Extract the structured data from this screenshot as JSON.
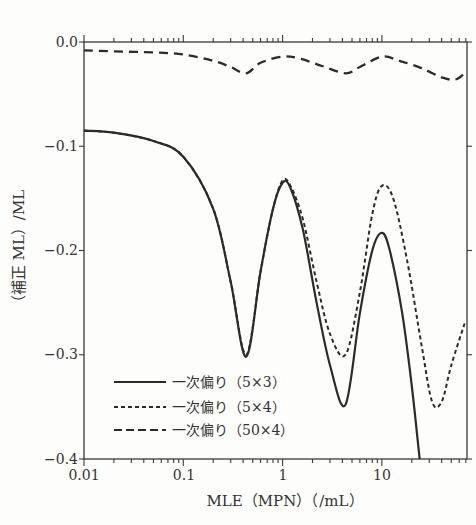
{
  "chart_data": {
    "type": "line",
    "title": "",
    "xlabel": "MLE（MPN）（/mL）",
    "ylabel": "（補正 ML）/ML",
    "xscale": "log",
    "xlim": [
      0.01,
      70
    ],
    "ylim": [
      -0.4,
      0.0
    ],
    "x_ticks": [
      "0.01",
      "0.1",
      "1",
      "10"
    ],
    "y_ticks": [
      "0.0",
      "−0.1",
      "−0.2",
      "−0.3",
      "−0.4"
    ],
    "grid": false,
    "legend_position": "lower-left",
    "series": [
      {
        "name": "一次偏り（5×3）",
        "style": "solid",
        "x": [
          0.01,
          0.02,
          0.05,
          0.1,
          0.2,
          0.3,
          0.43,
          0.6,
          0.8,
          1.0,
          1.2,
          1.6,
          2.2,
          3.0,
          4.3,
          6.0,
          8.0,
          10.0,
          12.0,
          16.0,
          20.0,
          24.0
        ],
        "y": [
          -0.085,
          -0.087,
          -0.095,
          -0.11,
          -0.16,
          -0.23,
          -0.302,
          -0.22,
          -0.16,
          -0.135,
          -0.14,
          -0.18,
          -0.25,
          -0.31,
          -0.348,
          -0.26,
          -0.2,
          -0.183,
          -0.2,
          -0.26,
          -0.33,
          -0.4
        ]
      },
      {
        "name": "一次偏り（5×4）",
        "style": "dotted",
        "x": [
          0.01,
          0.02,
          0.05,
          0.1,
          0.2,
          0.3,
          0.43,
          0.6,
          0.8,
          1.0,
          1.2,
          1.6,
          2.2,
          3.0,
          4.3,
          6.0,
          8.0,
          10.0,
          13.0,
          18.0,
          25.0,
          32.0,
          40.0,
          50.0,
          68.0
        ],
        "y": [
          -0.085,
          -0.087,
          -0.095,
          -0.11,
          -0.16,
          -0.23,
          -0.3,
          -0.22,
          -0.16,
          -0.133,
          -0.138,
          -0.17,
          -0.23,
          -0.28,
          -0.3,
          -0.24,
          -0.165,
          -0.138,
          -0.15,
          -0.21,
          -0.29,
          -0.345,
          -0.345,
          -0.31,
          -0.27
        ]
      },
      {
        "name": "一次偏り（50×4）",
        "style": "dashed",
        "x": [
          0.01,
          0.02,
          0.05,
          0.1,
          0.2,
          0.3,
          0.43,
          0.6,
          1.0,
          1.5,
          2.5,
          4.3,
          6.0,
          10.0,
          15.0,
          25.0,
          40.0,
          55.0,
          68.0
        ],
        "y": [
          -0.008,
          -0.009,
          -0.01,
          -0.012,
          -0.018,
          -0.024,
          -0.03,
          -0.02,
          -0.014,
          -0.016,
          -0.023,
          -0.03,
          -0.024,
          -0.014,
          -0.018,
          -0.025,
          -0.034,
          -0.036,
          -0.03
        ]
      }
    ]
  },
  "legend": {
    "items": [
      {
        "label": "一次偏り（5×3）",
        "style": "solid"
      },
      {
        "label": "一次偏り（5×4）",
        "style": "dotted"
      },
      {
        "label": "一次偏り（50×4）",
        "style": "dashed"
      }
    ]
  },
  "axes": {
    "x": {
      "title": "MLE（MPN）（/mL）",
      "ticks": [
        "0.01",
        "0.1",
        "1",
        "10"
      ]
    },
    "y": {
      "title": "（補正 ML）/ML",
      "ticks": [
        "0.0",
        "−0.1",
        "−0.2",
        "−0.3",
        "−0.4"
      ]
    }
  },
  "colors": {
    "line": "#2b2b2b",
    "background": "#fdfdfb",
    "frame": "#3a3a3a"
  }
}
